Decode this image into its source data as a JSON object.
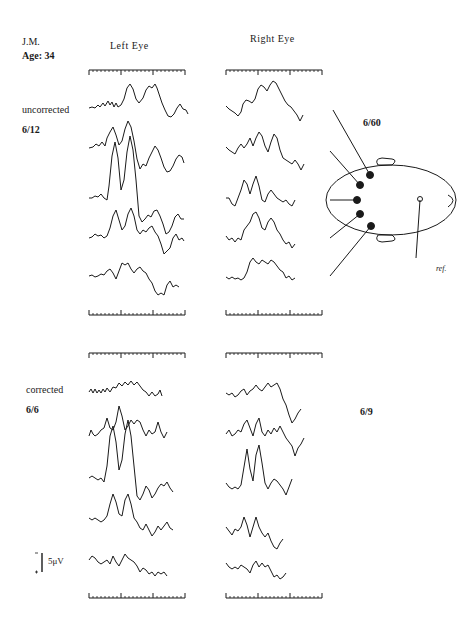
{
  "subject": {
    "initials": "J.M.",
    "age_label": "Age:",
    "age_value": "34"
  },
  "columns": {
    "left": "Left Eye",
    "right": "Right Eye"
  },
  "conditions": [
    {
      "label": "uncorrected",
      "left_acuity": "6/12",
      "right_acuity": "6/60"
    },
    {
      "label": "corrected",
      "left_acuity": "6/6",
      "right_acuity": "6/9"
    }
  ],
  "head_diagram": {
    "active_electrodes": 5,
    "reference_label": "ref."
  },
  "scale_bar": {
    "label": "5μV",
    "minus": "-",
    "plus": "+"
  },
  "colors": {
    "ink": "#1a1a1a",
    "background": "#ffffff"
  }
}
